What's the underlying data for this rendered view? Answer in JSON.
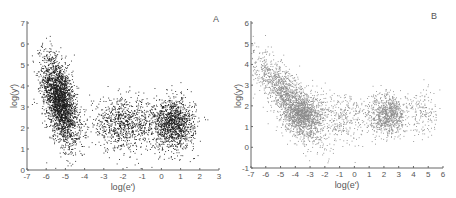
{
  "chart_data": [
    {
      "type": "scatter",
      "panel_label": "A",
      "title": "",
      "xlabel": "log(e')",
      "ylabel": "log(y')",
      "xlim": [
        -7,
        3
      ],
      "ylim": [
        0,
        7
      ],
      "xticks": [
        -7,
        -6,
        -5,
        -4,
        -3,
        -2,
        -1,
        0,
        1,
        2,
        3
      ],
      "yticks": [
        0,
        1,
        2,
        3,
        4,
        5,
        6,
        7
      ],
      "grid": false,
      "point_color": "#1a1a1a",
      "clusters": [
        {
          "name": "steep cluster",
          "x_center": -5.3,
          "y_center": 3.3,
          "x_spread": 0.45,
          "y_spread": 0.9,
          "slope": -1.2,
          "n": 2600
        },
        {
          "name": "middle cluster",
          "x_center": -2.0,
          "y_center": 2.2,
          "x_spread": 0.9,
          "y_spread": 0.6,
          "slope": 0,
          "n": 900
        },
        {
          "name": "right cluster",
          "x_center": 0.6,
          "y_center": 2.2,
          "x_spread": 0.55,
          "y_spread": 0.6,
          "slope": 0,
          "n": 1300
        }
      ]
    },
    {
      "type": "scatter",
      "panel_label": "B",
      "title": "",
      "xlabel": "log(e')",
      "ylabel": "log(y')",
      "xlim": [
        -7,
        6
      ],
      "ylim": [
        -1,
        6
      ],
      "xticks": [
        -7,
        -6,
        -5,
        -4,
        -3,
        -2,
        -1,
        0,
        1,
        2,
        3,
        4,
        5,
        6
      ],
      "yticks": [
        -1,
        0,
        1,
        2,
        3,
        4,
        5,
        6
      ],
      "grid": false,
      "point_color": "#8a8a8a",
      "clusters": [
        {
          "name": "descending band",
          "x_center": -4.5,
          "y_center": 2.4,
          "x_spread": 1.2,
          "y_spread": 0.6,
          "slope": -0.75,
          "n": 1500
        },
        {
          "name": "dense cluster",
          "x_center": -3.5,
          "y_center": 1.6,
          "x_spread": 0.7,
          "y_spread": 0.55,
          "slope": 0,
          "n": 900
        },
        {
          "name": "middle sparse",
          "x_center": -0.8,
          "y_center": 1.5,
          "x_spread": 0.8,
          "y_spread": 0.6,
          "slope": 0,
          "n": 300
        },
        {
          "name": "right cluster",
          "x_center": 2.2,
          "y_center": 1.6,
          "x_spread": 0.7,
          "y_spread": 0.5,
          "slope": 0,
          "n": 900
        },
        {
          "name": "far right sparse",
          "x_center": 4.6,
          "y_center": 1.6,
          "x_spread": 0.5,
          "y_spread": 0.6,
          "slope": 0,
          "n": 150
        }
      ]
    }
  ]
}
